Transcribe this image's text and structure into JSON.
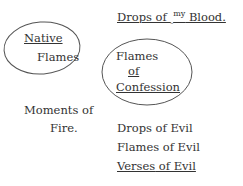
{
  "heading": {
    "part1": "Drops of ",
    "caret": "‸",
    "insert": "my",
    "part2": " Blood."
  },
  "circled_left": {
    "line1": "Native",
    "line2": "Flames"
  },
  "circled_center": {
    "line1": "Flames",
    "line2": "of",
    "line3": "Confession"
  },
  "left_note": {
    "line1": "Moments of",
    "line2": "Fire."
  },
  "list": [
    {
      "text": "Drops of Evil"
    },
    {
      "text": "Flames of Evil"
    },
    {
      "text1": "Verses",
      "text2": " of Evil"
    }
  ],
  "colors": {
    "ink": "#333333",
    "circle": "#555555"
  }
}
